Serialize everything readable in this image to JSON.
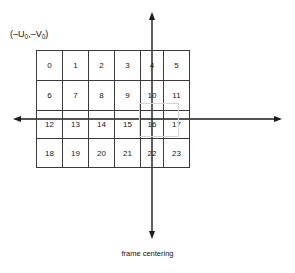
{
  "figure": {
    "caption": "frame centering",
    "offset_label": {
      "full_text": "(–U₀,–V₀)",
      "open_paren": "(",
      "u_sign": "–",
      "u_symbol": "U",
      "u_subscript": "0",
      "comma": ",",
      "v_sign": "–",
      "v_symbol": "V",
      "v_subscript": "0",
      "close_paren": ")"
    },
    "colors": {
      "background": "#ffffff",
      "grid_line": "#3a3a3a",
      "axis_line": "#1a1a1a",
      "text": "#111111",
      "highlight_border": "#d5d5d5"
    },
    "grid": {
      "columns": 6,
      "rows": 4,
      "cells": [
        [
          "0",
          "1",
          "2",
          "3",
          "4",
          "5"
        ],
        [
          "6",
          "7",
          "8",
          "9",
          "10",
          "11"
        ],
        [
          "12",
          "13",
          "14",
          "15",
          "16",
          "17"
        ],
        [
          "18",
          "19",
          "20",
          "21",
          "22",
          "23"
        ]
      ]
    },
    "axes": {
      "vertical_axis": {
        "x": 152,
        "top_y": 13,
        "bottom_y": 238,
        "arrowheads": "both"
      },
      "horizontal_axis": {
        "y": 119,
        "left_x": 14,
        "right_x": 281,
        "arrowheads": "both"
      }
    }
  }
}
